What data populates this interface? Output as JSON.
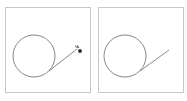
{
  "panels": [
    {
      "id": "left",
      "circle": {
        "cx": 28,
        "cy": 48,
        "r": 21
      },
      "line": {
        "x1": 43,
        "y1": 63,
        "x2": 72,
        "y2": 40
      },
      "cursor": {
        "x": 73,
        "y": 42,
        "visible": true
      }
    },
    {
      "id": "right",
      "circle": {
        "cx": 26,
        "cy": 48,
        "r": 21
      },
      "line": {
        "x1": 41,
        "y1": 63,
        "x2": 70,
        "y2": 42
      },
      "cursor": {
        "visible": false
      }
    }
  ],
  "colors": {
    "stroke": "#888888",
    "border": "#c8c8c8"
  }
}
